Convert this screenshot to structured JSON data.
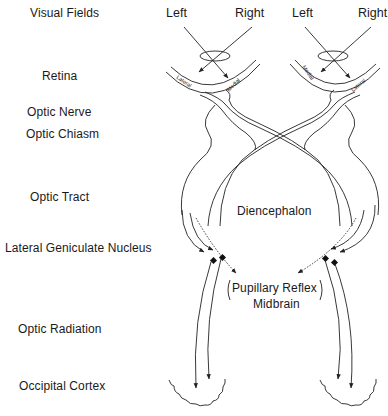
{
  "stage_labels": [
    {
      "id": "visual-fields",
      "text": "Visual Fields"
    },
    {
      "id": "retina",
      "text": "Retina"
    },
    {
      "id": "optic-nerve",
      "text": "Optic Nerve"
    },
    {
      "id": "optic-chiasm",
      "text": "Optic Chiasm"
    },
    {
      "id": "optic-tract",
      "text": "Optic Tract"
    },
    {
      "id": "lgn",
      "text": "Lateral Geniculate Nucleus"
    },
    {
      "id": "optic-radiation",
      "text": "Optic Radiation"
    },
    {
      "id": "occipital-cortex",
      "text": "Occipital Cortex"
    }
  ],
  "left_eye": {
    "field_left": "Left",
    "field_right": "Right",
    "retina_outer": "Lateral",
    "retina_inner": "Medial"
  },
  "right_eye": {
    "field_left": "Left",
    "field_right": "Right",
    "retina_inner": "Medial",
    "retina_outer": "Lateral"
  },
  "center_labels": {
    "diencephalon": "Diencephalon",
    "pupillary_reflex": "Pupillary Reflex",
    "midbrain": "Midbrain"
  },
  "colors": {
    "line": "#222222",
    "text": "#1a1a1a",
    "background": "#ffffff"
  }
}
